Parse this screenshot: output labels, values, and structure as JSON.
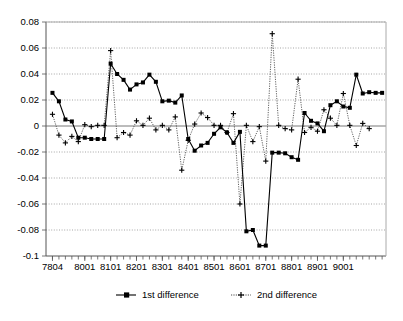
{
  "chart_data": {
    "type": "line",
    "title": "",
    "subtitle": "",
    "xlabel": "",
    "ylabel": "",
    "grid": true,
    "legend_position": "bottom",
    "ylim": [
      -0.1,
      0.08
    ],
    "ytick_labels": [
      "0.08",
      "0.06",
      "0.04",
      "0.02",
      "0",
      "-0.02",
      "-0.04",
      "-0.06",
      "-0.08",
      "-0.1"
    ],
    "ytick_values": [
      0.08,
      0.06,
      0.04,
      0.02,
      0,
      -0.02,
      -0.04,
      -0.06,
      -0.08,
      -0.1
    ],
    "xtick_labels": [
      "7804",
      "8001",
      "8101",
      "8201",
      "8301",
      "8401",
      "8501",
      "8601",
      "8701",
      "8801",
      "8901",
      "9001"
    ],
    "xtick_indices": [
      0,
      5,
      9,
      13,
      17,
      21,
      25,
      29,
      33,
      37,
      41,
      45
    ],
    "x": [
      "7804",
      "7901",
      "7902",
      "7903",
      "7904",
      "8001",
      "8002",
      "8003",
      "8004",
      "8101",
      "8102",
      "8103",
      "8104",
      "8201",
      "8202",
      "8203",
      "8204",
      "8301",
      "8302",
      "8303",
      "8304",
      "8401",
      "8402",
      "8403",
      "8404",
      "8501",
      "8502",
      "8503",
      "8504",
      "8601",
      "8602",
      "8603",
      "8604",
      "8701",
      "8702",
      "8703",
      "8704",
      "8801",
      "8802",
      "8803",
      "8804",
      "8901",
      "8902",
      "8903",
      "8904",
      "9001",
      "9002",
      "9003"
    ],
    "series": [
      {
        "name": "1st difference",
        "marker": "square",
        "linestyle": "solid",
        "color": "#000000",
        "values": [
          0.0255,
          0.019,
          0.005,
          0.0035,
          -0.009,
          -0.009,
          -0.01,
          -0.01,
          -0.01,
          0.048,
          0.04,
          0.0355,
          0.028,
          0.032,
          0.0335,
          0.0395,
          0.034,
          0.019,
          0.0195,
          0.018,
          0.0235,
          -0.01,
          -0.019,
          -0.015,
          -0.013,
          -0.006,
          -0.001,
          -0.005,
          -0.013,
          -0.0045,
          -0.081,
          -0.08,
          -0.092,
          -0.092,
          -0.0205,
          -0.0205,
          -0.021,
          -0.024,
          -0.026,
          0.01,
          0.004,
          0.002,
          -0.004,
          0.016,
          0.019,
          0.015,
          0.014,
          0.0395
        ]
      },
      {
        "name": "2nd difference",
        "marker": "plus",
        "linestyle": "dotted",
        "color": "#000000",
        "values": [
          0.009,
          -0.007,
          -0.013,
          -0.008,
          -0.012,
          0.001,
          -0.0005,
          0.0005,
          0.0005,
          0.058,
          -0.009,
          -0.005,
          -0.007,
          0.004,
          0.0005,
          0.006,
          -0.003,
          0.0005,
          -0.003,
          0.007,
          -0.034,
          -0.011,
          0.0015,
          0.01,
          0.0065,
          0.0005,
          0.0005,
          -0.005,
          0.0095,
          -0.06,
          0.0005,
          -0.012,
          -0.0005,
          -0.027,
          0.071,
          0.0005,
          -0.002,
          -0.003,
          0.036,
          -0.005,
          -0.001,
          -0.004,
          0.0125,
          0.006,
          0.0005,
          0.025,
          0.0005,
          -0.015
        ]
      }
    ],
    "tail": {
      "series1": [
        0.025,
        0.026,
        0.0255,
        0.0255
      ],
      "series2": [
        0.002,
        -0.002
      ]
    }
  },
  "legend": {
    "items": [
      {
        "label": "1st difference",
        "marker": "square"
      },
      {
        "label": "2nd difference",
        "marker": "plus"
      }
    ]
  }
}
